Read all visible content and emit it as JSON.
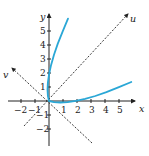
{
  "chart_data": {
    "type": "line",
    "title": "",
    "xlabel": "x",
    "ylabel": "y",
    "rotated_axes": [
      {
        "name": "u",
        "direction": "y = x (upper right)",
        "style": "dashed"
      },
      {
        "name": "v",
        "direction": "y = -x (upper left)",
        "style": "dashed"
      }
    ],
    "xlim": [
      -2.5,
      6
    ],
    "ylim": [
      -2.5,
      6
    ],
    "x_ticks": [
      -2,
      -1,
      1,
      2,
      3,
      4,
      5
    ],
    "y_ticks": [
      -2,
      -1,
      1,
      2,
      3,
      4,
      5
    ],
    "grid": false,
    "legend": null,
    "series": [
      {
        "name": "rotated parabola (x - y)^2 = 2√2 (x + y)",
        "color": "#2aa7d6",
        "points_xy": [
          [
            5.88,
            1.36
          ],
          [
            4.95,
            0.97
          ],
          [
            4.1,
            0.63
          ],
          [
            3.31,
            0.36
          ],
          [
            2.58,
            0.15
          ],
          [
            1.92,
            0.01
          ],
          [
            1.33,
            -0.08
          ],
          [
            0.81,
            -0.11
          ],
          [
            0.36,
            -0.08
          ],
          [
            0.0,
            0.0
          ],
          [
            -0.08,
            0.36
          ],
          [
            -0.11,
            0.81
          ],
          [
            -0.08,
            1.33
          ],
          [
            0.01,
            1.92
          ],
          [
            0.15,
            2.58
          ],
          [
            0.36,
            3.31
          ],
          [
            0.63,
            4.1
          ],
          [
            0.97,
            4.95
          ],
          [
            1.36,
            5.88
          ]
        ],
        "intercepts": {
          "x_axis": 2.83,
          "y_axis": 2.83
        }
      }
    ]
  },
  "labels": {
    "x_axis": "x",
    "y_axis": "y",
    "u_axis": "u",
    "v_axis": "v",
    "x_ticks": [
      "−2",
      "−1",
      "1",
      "2",
      "3",
      "4",
      "5"
    ],
    "y_ticks": [
      "5",
      "4",
      "3",
      "2",
      "1",
      "−1",
      "−2"
    ]
  },
  "colors": {
    "curve": "#2aa7d6",
    "axes": "#222222"
  }
}
